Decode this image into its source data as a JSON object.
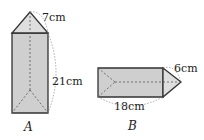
{
  "figures": [
    {
      "id": "A",
      "label": "A",
      "edge_label": "7cm",
      "height_label": "21cm"
    },
    {
      "id": "B",
      "label": "B",
      "edge_label": "6cm",
      "length_label": "18cm"
    }
  ],
  "colors": {
    "fill": "#cfcfcf",
    "fill_light": "#dcdcdc",
    "stroke": "#333333",
    "dash": "#777777"
  }
}
